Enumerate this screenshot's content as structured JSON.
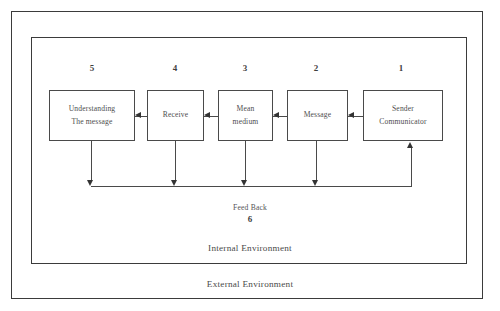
{
  "diagram": {
    "stages": [
      {
        "number": "5",
        "line1": "Understanding",
        "line2": "The message"
      },
      {
        "number": "4",
        "line1": "Receive",
        "line2": ""
      },
      {
        "number": "3",
        "line1": "Mean",
        "line2": "medium"
      },
      {
        "number": "2",
        "line1": "Message",
        "line2": ""
      },
      {
        "number": "1",
        "line1": "Sender",
        "line2": "Communicator"
      }
    ],
    "feedback": {
      "label": "Feed Back",
      "number": "6"
    },
    "environments": {
      "internal": "Internal Environment",
      "external": "External Environment"
    },
    "colors": {
      "border": "#3b3b3b",
      "box_border": "#4a4a4a",
      "arrow": "#333333",
      "text": "#4e4e4e",
      "background": "#ffffff"
    }
  }
}
